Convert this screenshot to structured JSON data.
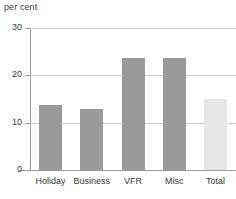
{
  "chart_data": {
    "type": "bar",
    "title": "",
    "ylabel": "per cent",
    "xlabel": "",
    "categories": [
      "Holiday",
      "Business",
      "VFR",
      "Misc",
      "Total"
    ],
    "values": [
      13.7,
      12.9,
      23.7,
      23.7,
      15.0
    ],
    "ylim": [
      0,
      30
    ],
    "yticks": [
      0,
      10,
      20,
      30
    ],
    "ytick_labels": [
      "0",
      "10",
      "20",
      "30"
    ],
    "grid": true,
    "gridlines_at": [
      10,
      20,
      30
    ],
    "legend": "none",
    "bar_colors": [
      "#9a9a9a",
      "#9a9a9a",
      "#9a9a9a",
      "#9a9a9a",
      "#e6e6e6"
    ],
    "series_colors": {
      "category_bar": "#9a9a9a",
      "total_bar": "#e6e6e6",
      "gridline": "#cfcfcf",
      "axis": "#9b9b9b",
      "text": "#3a3a3a"
    }
  }
}
